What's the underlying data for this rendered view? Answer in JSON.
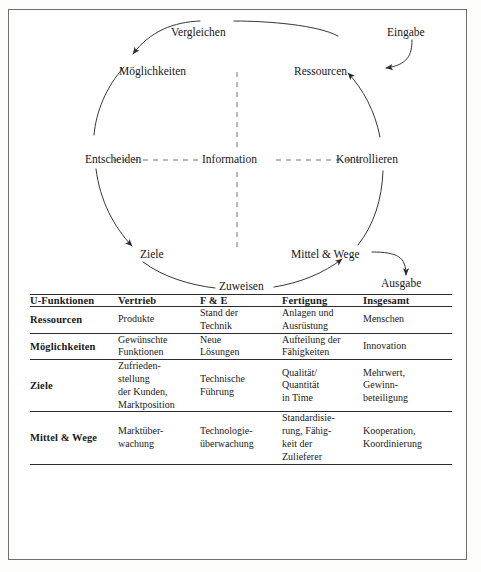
{
  "diagram": {
    "title_absent": true,
    "nodes": [
      {
        "id": "vergleichen",
        "label": "Vergleichen"
      },
      {
        "id": "moeglichkeiten",
        "label": "Möglichkeiten"
      },
      {
        "id": "ressourcen",
        "label": "Ressourcen"
      },
      {
        "id": "eingabe",
        "label": "Eingabe"
      },
      {
        "id": "entscheiden",
        "label": "Entscheiden"
      },
      {
        "id": "information",
        "label": "Information"
      },
      {
        "id": "kontrollieren",
        "label": "Kontrollieren"
      },
      {
        "id": "ziele",
        "label": "Ziele"
      },
      {
        "id": "mittel_wege",
        "label": "Mittel & Wege"
      },
      {
        "id": "zuweisen",
        "label": "Zuweisen"
      },
      {
        "id": "ausgabe",
        "label": "Ausgabe"
      }
    ],
    "colors": {
      "stroke": "#2b2b2b",
      "text": "#171717",
      "frame": "#6e6e6e"
    }
  },
  "table": {
    "columns": [
      "U-Funktionen",
      "Vertrieb",
      "F & E",
      "Fertigung",
      "Insgesamt"
    ],
    "rows": [
      {
        "header": "Ressourcen",
        "cells": [
          "Produkte",
          "Stand der\nTechnik",
          "Anlagen und\nAusrüstung",
          "Menschen"
        ]
      },
      {
        "header": "Möglichkeiten",
        "cells": [
          "Gewünschte\nFunktionen",
          "Neue\nLösungen",
          "Aufteilung der\nFähigkeiten",
          "Innovation"
        ]
      },
      {
        "header": "Ziele",
        "cells": [
          "Zufrieden-\nstellung\nder Kunden,\nMarktposition",
          "Technische\nFührung",
          "Qualität/\nQuantität\nin Time",
          "Mehrwert,\nGewinn-\nbeteiligung"
        ]
      },
      {
        "header": "Mittel & Wege",
        "cells": [
          "Marktüber-\nwachung",
          "Technologie-\nüberwachung",
          "Standardisie-\nrung, Fähig-\nkeit der\nZulieferer",
          "Kooperation,\nKoordinierung"
        ]
      }
    ]
  }
}
